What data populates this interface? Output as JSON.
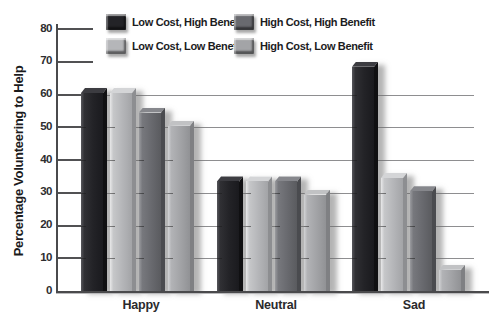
{
  "chart_data": {
    "type": "bar",
    "title": "",
    "ylabel": "Percentage Volunteering to Help",
    "xlabel": "",
    "ylim": [
      0,
      80
    ],
    "yticks": [
      0,
      10,
      20,
      30,
      40,
      50,
      60,
      70,
      80
    ],
    "gridlines_at": [
      10,
      20,
      30,
      40,
      50,
      60
    ],
    "categories": [
      "Happy",
      "Neutral",
      "Sad"
    ],
    "series": [
      {
        "name": "Low Cost, High Benefit",
        "color": "#232327",
        "values": [
          62,
          35,
          70
        ]
      },
      {
        "name": "Low Cost, Low Benefit",
        "color": "#b5b6b9",
        "values": [
          62,
          35,
          36
        ]
      },
      {
        "name": "High Cost, High Benefit",
        "color": "#696a6f",
        "values": [
          56,
          35,
          32
        ]
      },
      {
        "name": "High Cost, Low Benefit",
        "color": "#a3a4a7",
        "values": [
          52,
          31,
          8
        ]
      }
    ],
    "legend_position": "top",
    "legend_columns": 2,
    "legend_display_order": [
      0,
      2,
      1,
      3
    ],
    "grid": true
  }
}
